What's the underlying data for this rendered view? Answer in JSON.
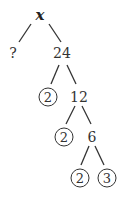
{
  "diagram": {
    "type": "factor-tree",
    "root": "x",
    "nodes": [
      {
        "id": "root",
        "label": "x",
        "x": 40,
        "y": 15,
        "circled": false
      },
      {
        "id": "unknown",
        "label": "?",
        "x": 13,
        "y": 53,
        "circled": false
      },
      {
        "id": "n24",
        "label": "24",
        "x": 62,
        "y": 53,
        "circled": false
      },
      {
        "id": "p2a",
        "label": "2",
        "x": 48,
        "y": 97,
        "circled": true
      },
      {
        "id": "n12",
        "label": "12",
        "x": 79,
        "y": 97,
        "circled": false
      },
      {
        "id": "p2b",
        "label": "2",
        "x": 64,
        "y": 137,
        "circled": true
      },
      {
        "id": "n6",
        "label": "6",
        "x": 92,
        "y": 137,
        "circled": false
      },
      {
        "id": "p2c",
        "label": "2",
        "x": 80,
        "y": 178,
        "circled": true
      },
      {
        "id": "p3",
        "label": "3",
        "x": 107,
        "y": 178,
        "circled": true
      }
    ],
    "edges": [
      {
        "from": "root",
        "to": "unknown"
      },
      {
        "from": "root",
        "to": "n24"
      },
      {
        "from": "n24",
        "to": "p2a"
      },
      {
        "from": "n24",
        "to": "n12"
      },
      {
        "from": "n12",
        "to": "p2b"
      },
      {
        "from": "n12",
        "to": "n6"
      },
      {
        "from": "n6",
        "to": "p2c"
      },
      {
        "from": "n6",
        "to": "p3"
      }
    ]
  }
}
